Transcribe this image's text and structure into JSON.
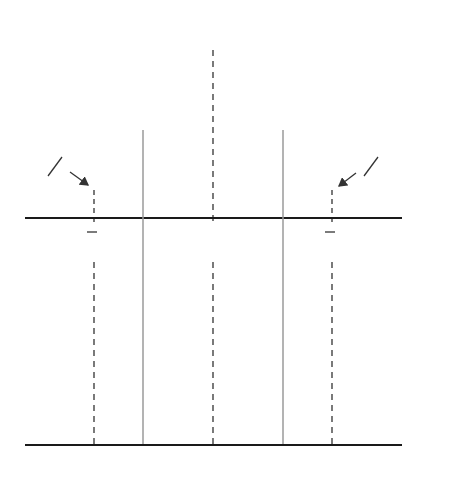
{
  "diagram": {
    "top_panel": {
      "hypothesis_label": "H",
      "hypothesis_sub": "0",
      "axis_label": "x̄'s",
      "center_label": "μ",
      "left_point": {
        "main": "X",
        "sub": "1",
        "overbar": true
      },
      "right_point": {
        "main": "X",
        "sub": "3",
        "overbar": true
      },
      "tail_label_left": {
        "num": "α",
        "den": "2"
      },
      "tail_label_right": {
        "num": "α",
        "den": "2"
      }
    },
    "bottom_panel": {
      "axis_label": "z",
      "ticks": [
        {
          "id": "neg-zc1",
          "main": "-z",
          "sub": "c",
          "subsub": "1"
        },
        {
          "id": "neg-z-alpha-half",
          "main": "-z",
          "sub": "α/2"
        },
        {
          "id": "zero",
          "main": "0"
        },
        {
          "id": "z-alpha-half",
          "main": "z",
          "sub": "α/2"
        },
        {
          "id": "zc3",
          "main": "z",
          "sub": "c",
          "subsub": "3"
        }
      ]
    },
    "colors": {
      "curve": "#8c8c8c",
      "shade": "#b4b4b4",
      "axis": "#1a1a1a",
      "guide": "#9a9a9a",
      "text": "#333333"
    }
  }
}
